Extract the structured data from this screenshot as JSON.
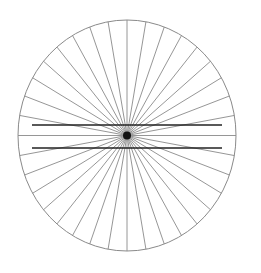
{
  "figure": {
    "name": "Hering illusion",
    "center": [
      127,
      135.5
    ],
    "rx": 109,
    "ry": 115.5,
    "spoke_count": 36,
    "spoke_step_deg": 10,
    "colors": {
      "background": "#ffffff",
      "circle": "#8a8a8a",
      "spokes": "#8a8a8a",
      "parallel_lines": "#222222",
      "center_blob": "#111111"
    },
    "parallel_lines": [
      {
        "x1": 32,
        "x2": 222,
        "y": 125
      },
      {
        "x1": 32,
        "x2": 222,
        "y": 148
      }
    ]
  }
}
